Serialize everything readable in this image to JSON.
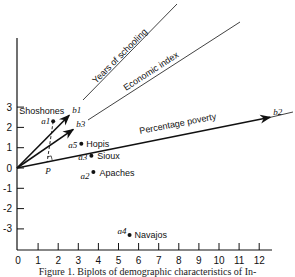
{
  "chart_data": {
    "type": "scatter",
    "title": "",
    "xlabel": "",
    "ylabel": "",
    "xlim": [
      0,
      12.5
    ],
    "ylim": [
      -3.9,
      3.5
    ],
    "x_ticks": [
      "0",
      "1",
      "2",
      "3",
      "4",
      "5",
      "6",
      "7",
      "8",
      "9",
      "10",
      "11",
      "12"
    ],
    "y_ticks": [
      "3",
      "2",
      "1",
      "0",
      "-1",
      "-2",
      "-3"
    ],
    "points": [
      {
        "id": "a1",
        "name": "Shoshones",
        "x": 1.8,
        "y": 2.3
      },
      {
        "id": "a5",
        "name": "Hopis",
        "x": 3.2,
        "y": 1.2
      },
      {
        "id": "a3",
        "name": "Sioux",
        "x": 3.7,
        "y": 0.6
      },
      {
        "id": "a2",
        "name": "Apaches",
        "x": 3.8,
        "y": -0.2
      },
      {
        "id": "a4",
        "name": "Navajos",
        "x": 5.6,
        "y": -3.3
      }
    ],
    "vectors": [
      {
        "id": "b1",
        "name": "Years of schooling",
        "x": 2.6,
        "y": 2.6
      },
      {
        "id": "b3",
        "name": "Economic index",
        "x": 2.8,
        "y": 1.9
      },
      {
        "id": "b2",
        "name": "Percentage poverty",
        "x": 12.6,
        "y": 2.5
      }
    ],
    "projection": {
      "label": "P",
      "from": "a1",
      "onto": "b2",
      "x": 1.5,
      "y": 0.3
    }
  },
  "caption": "Figure 1.  Biplots of demographic characteristics of In-"
}
